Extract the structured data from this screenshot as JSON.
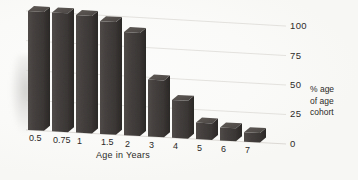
{
  "chart_data": {
    "type": "bar",
    "title": "",
    "subtitle": "",
    "xlabel": "Age in Years",
    "ylabel": "% age of age cohort",
    "ylabel_lines": [
      "% age",
      "of age",
      "cohort"
    ],
    "categories": [
      "0.5",
      "0.75",
      "1",
      "1.5",
      "2",
      "3",
      "4",
      "5",
      "6",
      "7"
    ],
    "values": [
      100,
      100,
      99,
      95,
      87,
      48,
      32,
      14,
      11,
      8
    ],
    "ylim": [
      0,
      100
    ],
    "yticks": [
      0,
      25,
      50,
      75,
      100
    ],
    "ytick_labels": [
      "0",
      "25",
      "50",
      "75",
      "100"
    ],
    "grid": true,
    "grid_axis": "y",
    "legend": false,
    "legend_position": "none",
    "axis_side_y": "right",
    "style": "3d-bar",
    "series": [
      {
        "name": "% age of age cohort",
        "values": [
          100,
          100,
          99,
          95,
          87,
          48,
          32,
          14,
          11,
          8
        ]
      }
    ]
  },
  "colors": {
    "bar_front": "#46423f",
    "bar_side": "#332f2d",
    "bar_top": "#5a5551",
    "gridline": "#d6d3ce",
    "text": "#2b2928",
    "background": "#fdfdfc"
  },
  "geometry": {
    "plot_left": 28,
    "plot_right": 268,
    "baseline_left_y": 130,
    "baseline_right_y": 143,
    "top_left_y": 11,
    "top_right_y": 25,
    "bar_width": 16,
    "bar_gap": 8,
    "depth_x": 6,
    "depth_y": -5
  }
}
